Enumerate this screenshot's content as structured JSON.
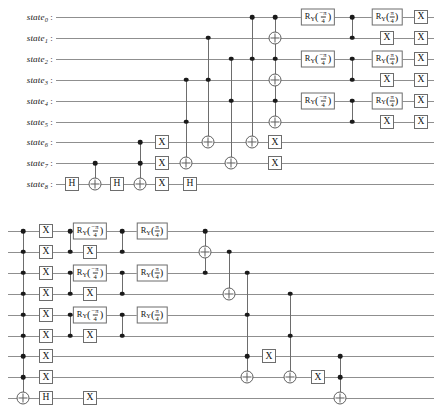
{
  "figure": {
    "type": "quantum-circuit-diagram",
    "panels": 2,
    "qubit_count": 9,
    "wire_labels": [
      "state0",
      "state1",
      "state2",
      "state3",
      "state4",
      "state5",
      "state6",
      "state7",
      "state8"
    ],
    "label_base": "state",
    "label_separator": ":",
    "colors": {
      "wire": "#8f8f8f",
      "gate_border": "#6d6d6d",
      "control_dot": "#1a1a1a",
      "target_ring": "#5e5e5e",
      "text": "#141414",
      "background": "#ffffff"
    },
    "gate_names": {
      "h": "H",
      "x": "X",
      "ry_neg": "RY(-pi/4)",
      "ry_pos": "RY(pi/4)"
    },
    "gate_labels": {
      "h": "H",
      "x": "X",
      "ry_symbol": "R",
      "ry_subscript": "Y",
      "pi": "π",
      "minus_pi": "−π",
      "denominator": "4"
    }
  },
  "top_panel": {
    "name": "top-circuit",
    "labels": [
      {
        "text": "state",
        "index": "0"
      },
      {
        "text": "state",
        "index": "1"
      },
      {
        "text": "state",
        "index": "2"
      },
      {
        "text": "state",
        "index": "3"
      },
      {
        "text": "state",
        "index": "4"
      },
      {
        "text": "state",
        "index": "5"
      },
      {
        "text": "state",
        "index": "6"
      },
      {
        "text": "state",
        "index": "7"
      },
      {
        "text": "state",
        "index": "8"
      }
    ],
    "boxes": [
      {
        "g": "h",
        "x": 72,
        "q": 8
      },
      {
        "g": "h",
        "x": 117,
        "q": 8
      },
      {
        "g": "x",
        "x": 162,
        "q": 6
      },
      {
        "g": "x",
        "x": 162,
        "q": 7
      },
      {
        "g": "x",
        "x": 162,
        "q": 8
      },
      {
        "g": "h",
        "x": 190,
        "q": 8
      },
      {
        "g": "x",
        "x": 275,
        "q": 7
      },
      {
        "g": "x",
        "x": 275,
        "q": 6
      },
      {
        "g": "ry_neg",
        "x": 318,
        "q": 0
      },
      {
        "g": "ry_neg",
        "x": 318,
        "q": 2
      },
      {
        "g": "ry_neg",
        "x": 318,
        "q": 4
      },
      {
        "g": "ry_pos",
        "x": 387,
        "q": 0
      },
      {
        "g": "ry_pos",
        "x": 387,
        "q": 2
      },
      {
        "g": "ry_pos",
        "x": 387,
        "q": 4
      },
      {
        "g": "x",
        "x": 387,
        "q": 1
      },
      {
        "g": "x",
        "x": 387,
        "q": 3
      },
      {
        "g": "x",
        "x": 387,
        "q": 5
      },
      {
        "g": "x",
        "x": 421,
        "q": 0
      },
      {
        "g": "x",
        "x": 421,
        "q": 1
      },
      {
        "g": "x",
        "x": 421,
        "q": 2
      },
      {
        "g": "x",
        "x": 421,
        "q": 3
      },
      {
        "g": "x",
        "x": 421,
        "q": 4
      },
      {
        "g": "x",
        "x": 421,
        "q": 5
      }
    ],
    "controls": [
      {
        "x": 95,
        "q": 7
      },
      {
        "x": 140,
        "q": 6
      },
      {
        "x": 140,
        "q": 7
      },
      {
        "x": 186,
        "q": 3
      },
      {
        "x": 186,
        "q": 5
      },
      {
        "x": 208,
        "q": 1
      },
      {
        "x": 208,
        "q": 3
      },
      {
        "x": 231,
        "q": 2
      },
      {
        "x": 231,
        "q": 4
      },
      {
        "x": 252,
        "q": 0
      },
      {
        "x": 252,
        "q": 2
      },
      {
        "x": 275,
        "q": 0
      },
      {
        "x": 275,
        "q": 2
      },
      {
        "x": 275,
        "q": 4
      },
      {
        "x": 352,
        "q": 0
      },
      {
        "x": 352,
        "q": 1
      },
      {
        "x": 352,
        "q": 2
      },
      {
        "x": 352,
        "q": 3
      },
      {
        "x": 352,
        "q": 4
      },
      {
        "x": 352,
        "q": 5
      }
    ],
    "targets": [
      {
        "x": 95,
        "q": 8
      },
      {
        "x": 140,
        "q": 8
      },
      {
        "x": 186,
        "q": 7
      },
      {
        "x": 208,
        "q": 6
      },
      {
        "x": 231,
        "q": 7
      },
      {
        "x": 252,
        "q": 6
      },
      {
        "x": 275,
        "q": 1
      },
      {
        "x": 275,
        "q": 3
      },
      {
        "x": 275,
        "q": 5
      }
    ],
    "vlines": [
      {
        "x": 95,
        "q1": 7,
        "q2": 8
      },
      {
        "x": 140,
        "q1": 6,
        "q2": 8
      },
      {
        "x": 186,
        "q1": 3,
        "q2": 7
      },
      {
        "x": 208,
        "q1": 1,
        "q2": 6
      },
      {
        "x": 231,
        "q1": 2,
        "q2": 7
      },
      {
        "x": 252,
        "q1": 0,
        "q2": 6
      },
      {
        "x": 275,
        "q1": 0,
        "q2": 5
      },
      {
        "x": 352,
        "q1": 0,
        "q2": 1
      },
      {
        "x": 352,
        "q1": 2,
        "q2": 3
      },
      {
        "x": 352,
        "q1": 4,
        "q2": 5
      }
    ]
  },
  "bottom_panel": {
    "name": "bottom-circuit",
    "boxes": [
      {
        "g": "x",
        "x": 46,
        "q": 0
      },
      {
        "g": "x",
        "x": 46,
        "q": 1
      },
      {
        "g": "x",
        "x": 46,
        "q": 2
      },
      {
        "g": "x",
        "x": 46,
        "q": 3
      },
      {
        "g": "x",
        "x": 46,
        "q": 4
      },
      {
        "g": "x",
        "x": 46,
        "q": 5
      },
      {
        "g": "x",
        "x": 46,
        "q": 6
      },
      {
        "g": "x",
        "x": 46,
        "q": 7
      },
      {
        "g": "h",
        "x": 46,
        "q": 8
      },
      {
        "g": "ry_neg",
        "x": 90,
        "q": 0
      },
      {
        "g": "ry_neg",
        "x": 90,
        "q": 2
      },
      {
        "g": "ry_neg",
        "x": 90,
        "q": 4
      },
      {
        "g": "x",
        "x": 90,
        "q": 1
      },
      {
        "g": "x",
        "x": 90,
        "q": 3
      },
      {
        "g": "x",
        "x": 90,
        "q": 5
      },
      {
        "g": "x",
        "x": 90,
        "q": 8
      },
      {
        "g": "ry_pos",
        "x": 152,
        "q": 0
      },
      {
        "g": "ry_pos",
        "x": 152,
        "q": 2
      },
      {
        "g": "ry_pos",
        "x": 152,
        "q": 4
      },
      {
        "g": "x",
        "x": 269,
        "q": 6
      },
      {
        "g": "x",
        "x": 318,
        "q": 7
      }
    ],
    "controls": [
      {
        "x": 23,
        "q": 0
      },
      {
        "x": 23,
        "q": 1
      },
      {
        "x": 23,
        "q": 2
      },
      {
        "x": 23,
        "q": 3
      },
      {
        "x": 23,
        "q": 4
      },
      {
        "x": 23,
        "q": 5
      },
      {
        "x": 23,
        "q": 6
      },
      {
        "x": 23,
        "q": 7
      },
      {
        "x": 70,
        "q": 0
      },
      {
        "x": 70,
        "q": 1
      },
      {
        "x": 70,
        "q": 2
      },
      {
        "x": 70,
        "q": 3
      },
      {
        "x": 70,
        "q": 4
      },
      {
        "x": 70,
        "q": 5
      },
      {
        "x": 122,
        "q": 0
      },
      {
        "x": 122,
        "q": 1
      },
      {
        "x": 122,
        "q": 2
      },
      {
        "x": 122,
        "q": 3
      },
      {
        "x": 122,
        "q": 4
      },
      {
        "x": 122,
        "q": 5
      },
      {
        "x": 205,
        "q": 0
      },
      {
        "x": 205,
        "q": 2
      },
      {
        "x": 229,
        "q": 1
      },
      {
        "x": 229,
        "q": 3
      },
      {
        "x": 247,
        "q": 2
      },
      {
        "x": 247,
        "q": 4
      },
      {
        "x": 247,
        "q": 6
      },
      {
        "x": 290,
        "q": 3
      },
      {
        "x": 290,
        "q": 5
      },
      {
        "x": 340,
        "q": 6
      },
      {
        "x": 340,
        "q": 7
      }
    ],
    "targets": [
      {
        "x": 23,
        "q": 8
      },
      {
        "x": 205,
        "q": 1
      },
      {
        "x": 229,
        "q": 3
      },
      {
        "x": 247,
        "q": 7
      },
      {
        "x": 290,
        "q": 7
      },
      {
        "x": 340,
        "q": 8
      }
    ],
    "vlines": [
      {
        "x": 23,
        "q1": 0,
        "q2": 8
      },
      {
        "x": 70,
        "q1": 0,
        "q2": 1
      },
      {
        "x": 70,
        "q1": 2,
        "q2": 3
      },
      {
        "x": 70,
        "q1": 4,
        "q2": 5
      },
      {
        "x": 122,
        "q1": 0,
        "q2": 1
      },
      {
        "x": 122,
        "q1": 2,
        "q2": 3
      },
      {
        "x": 122,
        "q1": 4,
        "q2": 5
      },
      {
        "x": 205,
        "q1": 0,
        "q2": 2
      },
      {
        "x": 229,
        "q1": 1,
        "q2": 3
      },
      {
        "x": 247,
        "q1": 2,
        "q2": 7
      },
      {
        "x": 290,
        "q1": 3,
        "q2": 7
      },
      {
        "x": 340,
        "q1": 6,
        "q2": 8
      }
    ]
  },
  "geometry": {
    "top_y0": 17,
    "bottom_y0": 231,
    "row_step": 20.9,
    "wire_left_top": 56,
    "wire_left_bottom": 8,
    "wire_right": 434
  }
}
